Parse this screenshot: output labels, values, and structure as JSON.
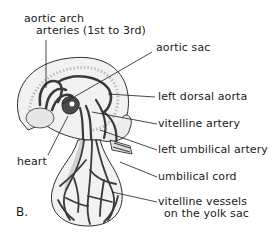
{
  "figure": {
    "panel_letter": "B.",
    "colors": {
      "ink": "#1a1a1a",
      "vessel": "#3a3a3a",
      "tissue": "#f2f2f2",
      "tissue_shade": "#d9d9d9",
      "background": "#ffffff"
    }
  },
  "labels": {
    "aortic_arch_line1": "aortic arch",
    "aortic_arch_line2": "arteries (1st to 3rd)",
    "aortic_sac": "aortic sac",
    "left_dorsal_aorta": "left dorsal aorta",
    "vitelline_artery": "vitelline artery",
    "left_umbilical_artery": "left umbilical artery",
    "heart": "heart",
    "umbilical_cord": "umbilical cord",
    "vitelline_vessels_line1": "vitelline vessels",
    "vitelline_vessels_line2": "on the yolk sac"
  }
}
